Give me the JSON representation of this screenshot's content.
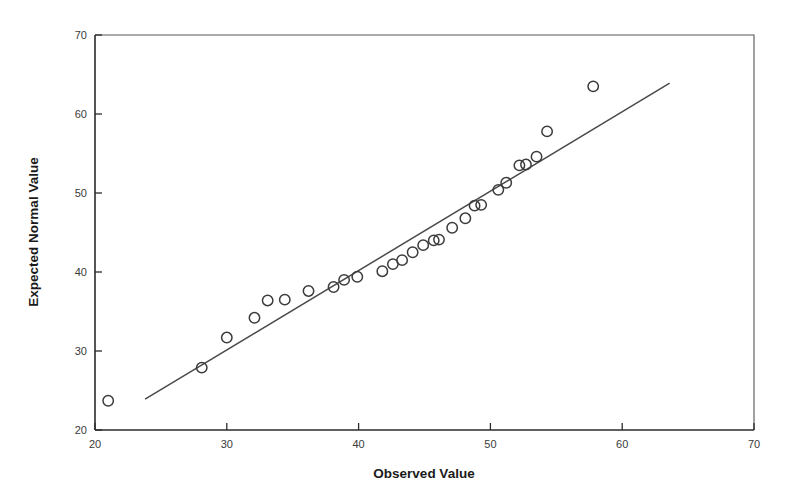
{
  "figure": {
    "background_color": "#ffffff",
    "frame_color": "#555555",
    "axis_color": "#2b2b2b"
  },
  "axis_titles": {
    "x": "Observed Value",
    "y": "Expected Normal Value"
  },
  "chart_data": {
    "type": "scatter",
    "title": "",
    "subtitle": "",
    "xlabel": "Observed Value",
    "ylabel": "Expected Normal Value",
    "xlim": [
      20,
      70
    ],
    "ylim": [
      20,
      70
    ],
    "xticks": [
      20,
      30,
      40,
      50,
      60,
      70
    ],
    "yticks": [
      20,
      30,
      40,
      50,
      60,
      70
    ],
    "xtick_labels": [
      "20",
      "30",
      "40",
      "50",
      "60",
      "70"
    ],
    "ytick_labels": [
      "20",
      "30",
      "40",
      "50",
      "60",
      "70"
    ],
    "grid": false,
    "legend": false,
    "legend_position": "none",
    "marker": {
      "shape": "circle-open",
      "size": 5.2,
      "edge_color": "#3b3b3b",
      "fill": "none"
    },
    "series": [
      {
        "name": "Q-Q points",
        "type": "scatter",
        "points": [
          {
            "x": 21.0,
            "y": 23.7
          },
          {
            "x": 28.1,
            "y": 27.9
          },
          {
            "x": 30.0,
            "y": 31.7
          },
          {
            "x": 32.1,
            "y": 34.2
          },
          {
            "x": 33.1,
            "y": 36.4
          },
          {
            "x": 34.4,
            "y": 36.5
          },
          {
            "x": 36.2,
            "y": 37.6
          },
          {
            "x": 38.1,
            "y": 38.1
          },
          {
            "x": 38.9,
            "y": 39.0
          },
          {
            "x": 39.9,
            "y": 39.4
          },
          {
            "x": 41.8,
            "y": 40.1
          },
          {
            "x": 42.6,
            "y": 41.0
          },
          {
            "x": 43.3,
            "y": 41.5
          },
          {
            "x": 44.1,
            "y": 42.5
          },
          {
            "x": 44.9,
            "y": 43.4
          },
          {
            "x": 45.7,
            "y": 44.0
          },
          {
            "x": 46.1,
            "y": 44.1
          },
          {
            "x": 47.1,
            "y": 45.6
          },
          {
            "x": 48.1,
            "y": 46.8
          },
          {
            "x": 48.8,
            "y": 48.4
          },
          {
            "x": 49.3,
            "y": 48.5
          },
          {
            "x": 50.6,
            "y": 50.4
          },
          {
            "x": 51.2,
            "y": 51.3
          },
          {
            "x": 52.2,
            "y": 53.5
          },
          {
            "x": 52.7,
            "y": 53.6
          },
          {
            "x": 53.5,
            "y": 54.6
          },
          {
            "x": 54.3,
            "y": 57.8
          },
          {
            "x": 57.8,
            "y": 63.5
          }
        ]
      },
      {
        "name": "Reference line",
        "type": "line",
        "endpoints": [
          {
            "x": 23.8,
            "y": 23.9
          },
          {
            "x": 63.6,
            "y": 63.9
          }
        ],
        "color": "#4a4a4a"
      }
    ]
  }
}
